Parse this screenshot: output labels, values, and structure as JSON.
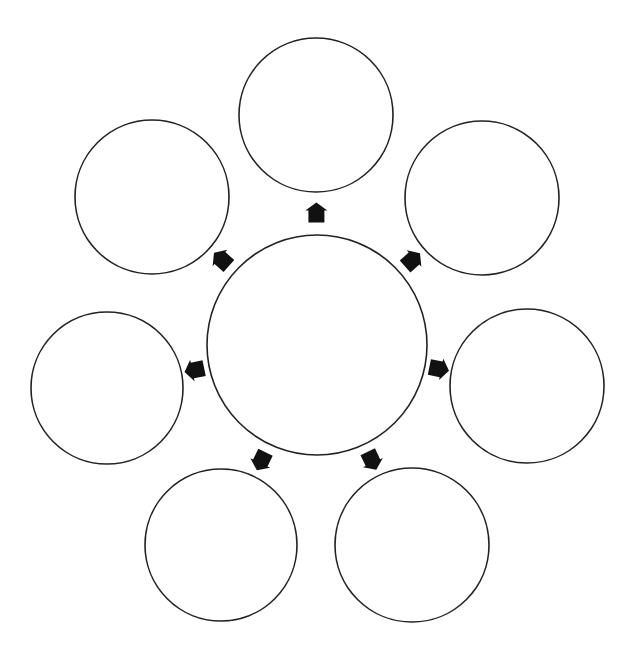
{
  "diagram": {
    "type": "hub-and-spoke",
    "center_node": {
      "label": ""
    },
    "outer_nodes": [
      {
        "id": "top",
        "label": ""
      },
      {
        "id": "top-right",
        "label": ""
      },
      {
        "id": "right",
        "label": ""
      },
      {
        "id": "bottom-right",
        "label": ""
      },
      {
        "id": "bottom-left",
        "label": ""
      },
      {
        "id": "left",
        "label": ""
      },
      {
        "id": "top-left",
        "label": ""
      }
    ],
    "arrow_direction": "outward",
    "colors": {
      "stroke": "#222222",
      "arrow": "#111111",
      "background": "#ffffff"
    }
  }
}
